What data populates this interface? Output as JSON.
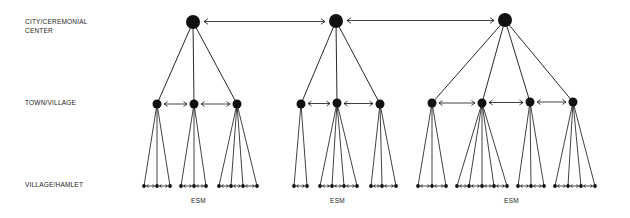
{
  "levels": {
    "city": {
      "line1": "CITY/CEREMONIAL",
      "line2": "CENTER"
    },
    "town": "TOWN/VILLAGE",
    "hamlet": "VILLAGE/HAMLET"
  },
  "colors": {
    "ink": "#111111",
    "background": "#ffffff"
  },
  "groups": [
    {
      "label": "ESM",
      "label_x": 199,
      "city": {
        "x": 193,
        "y": 22
      },
      "towns": [
        {
          "x": 157,
          "y": 104,
          "hamlets": [
            144,
            157,
            170
          ]
        },
        {
          "x": 194,
          "y": 104,
          "hamlets": [
            181,
            194,
            206
          ]
        },
        {
          "x": 237,
          "y": 104,
          "hamlets": [
            219,
            231,
            243,
            257
          ]
        }
      ]
    },
    {
      "label": "ESM",
      "label_x": 338,
      "city": {
        "x": 336,
        "y": 21
      },
      "towns": [
        {
          "x": 301,
          "y": 104,
          "hamlets": [
            294,
            307
          ]
        },
        {
          "x": 337,
          "y": 103,
          "hamlets": [
            320,
            332,
            344,
            357
          ]
        },
        {
          "x": 380,
          "y": 104,
          "hamlets": [
            371,
            382,
            396
          ]
        }
      ]
    },
    {
      "label": "ESM",
      "label_x": 512,
      "city": {
        "x": 505,
        "y": 20
      },
      "towns": [
        {
          "x": 432,
          "y": 103,
          "hamlets": [
            418,
            432,
            446
          ]
        },
        {
          "x": 482,
          "y": 103,
          "hamlets": [
            457,
            469,
            482,
            494,
            507
          ]
        },
        {
          "x": 530,
          "y": 102,
          "hamlets": [
            518,
            531,
            544
          ]
        },
        {
          "x": 573,
          "y": 102,
          "hamlets": [
            555,
            568,
            581,
            595
          ]
        }
      ]
    }
  ],
  "hamlet_y": 186,
  "label_y": 197
}
